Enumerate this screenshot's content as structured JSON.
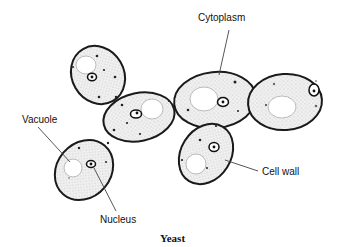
{
  "diagram": {
    "title": "Yeast",
    "labels": {
      "cytoplasm": "Cytoplasm",
      "vacuole": "Vacuole",
      "cell_wall": "Cell wall",
      "nucleus": "Nucleus"
    },
    "colors": {
      "stroke": "#1a1a1a",
      "fill": "#e6e6e6",
      "background": "#ffffff"
    }
  }
}
